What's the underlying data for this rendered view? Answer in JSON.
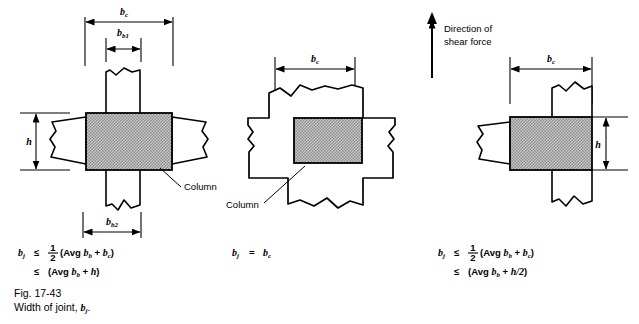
{
  "figure": {
    "caption_line1": "Fig. 17-43",
    "caption_line2": "Width of joint, b",
    "caption_line2_sub": "j",
    "caption_line2_end": ".",
    "background_color": "#ffffff",
    "line_color": "#000000",
    "column_fill_color": "#b3b3b3"
  },
  "annotations": {
    "direction_label_line1": "Direction of",
    "direction_label_line2": "shear force",
    "column_label": "Column"
  },
  "dimensions": {
    "bc": "b",
    "bc_sub": "c",
    "bb1": "b",
    "bb1_sub": "b1",
    "bb2": "b",
    "bb2_sub": "b2",
    "h": "h"
  },
  "panels": [
    {
      "id": "panel-left",
      "name": "interior-joint-elevation",
      "dimension_labels": [
        "b_c",
        "b_b1",
        "b_b2",
        "h"
      ],
      "callout": "Column",
      "formula_lines": [
        {
          "lhs": "b",
          "lhs_sub": "j",
          "rel": "≤",
          "frac_num": "1",
          "frac_den": "2",
          "rhs": "(Avg b",
          "rhs_sub": "b",
          "rhs_mid": " + b",
          "rhs_sub2": "c",
          "rhs_end": ")"
        },
        {
          "rel": "≤",
          "rhs": "(Avg b",
          "rhs_sub": "b",
          "rhs_mid": " + ",
          "rhs_sub2": "h",
          "rhs_end": ")"
        }
      ]
    },
    {
      "id": "panel-middle",
      "name": "joint-plan-view",
      "dimension_labels": [
        "b_c"
      ],
      "callout": "Column",
      "formula_lines": [
        {
          "lhs": "b",
          "lhs_sub": "j",
          "rel": "=",
          "rhs": "b",
          "rhs_sub": "c"
        }
      ]
    },
    {
      "id": "panel-right",
      "name": "eccentric-joint-elevation",
      "dimension_labels": [
        "b_c",
        "h"
      ],
      "formula_lines": [
        {
          "lhs": "b",
          "lhs_sub": "j",
          "rel": "≤",
          "frac_num": "1",
          "frac_den": "2",
          "rhs": "(Avg b",
          "rhs_sub": "b",
          "rhs_mid": " + b",
          "rhs_sub2": "c",
          "rhs_end": ")"
        },
        {
          "rel": "≤",
          "rhs": "(Avg b",
          "rhs_sub": "b",
          "rhs_mid": " + ",
          "rhs_sub2": "h/2",
          "rhs_end": ")"
        }
      ]
    }
  ]
}
